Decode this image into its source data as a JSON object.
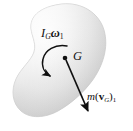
{
  "figure": {
    "name": "rigid-body-momentum-diagram",
    "background_color": "#ffffff",
    "width": 133,
    "height": 131
  },
  "body_shape": {
    "name": "rigid-body-blob",
    "fill_light": "#fbfbfb",
    "fill_mid": "#e2e2e2",
    "fill_dark": "#b9b9b9",
    "outline_color": "#c9c9c9"
  },
  "labels": {
    "angular_momentum": {
      "symbol": "I",
      "symbol_subscript": "G",
      "factor": "ω",
      "factor_subscript": "1",
      "plain": "I_G ω_1"
    },
    "linear_momentum": {
      "mass": "m",
      "open_paren": "(",
      "vector": "v",
      "vector_subscript": "G",
      "close_paren": ")",
      "state_subscript": "1",
      "plain": "m(v_G)_1"
    },
    "center_of_mass": {
      "text": "G"
    }
  },
  "markers": {
    "center_point": {
      "name": "center-of-mass-point",
      "x": 65,
      "y": 58,
      "color": "#101010"
    }
  },
  "arrows": {
    "angular_momentum_arc": {
      "name": "curved-rotation-arrow",
      "direction": "counterclockwise",
      "color": "#101010"
    },
    "linear_momentum_vector": {
      "name": "linear-momentum-arrow",
      "from_x": 66,
      "from_y": 60,
      "to_x": 89,
      "to_y": 114,
      "color": "#101010"
    }
  }
}
